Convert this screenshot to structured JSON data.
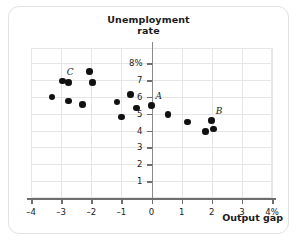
{
  "chart_data": {
    "type": "scatter",
    "title": "Unemployment rate",
    "title_line1": "Unemployment",
    "title_line2": "rate",
    "xlabel": "Output gap",
    "ylabel": "Unemployment rate",
    "xlim": [
      -4,
      4
    ],
    "ylim": [
      0,
      8.9
    ],
    "grid": true,
    "legend": "none",
    "x_unit": "%",
    "y_unit": "%",
    "xticks": [
      -4,
      -3,
      -2,
      -1,
      0,
      1,
      2,
      3,
      4
    ],
    "xticklabels": [
      "–4",
      "–3",
      "–2",
      "–1",
      "0",
      "1",
      "2",
      "3",
      "4%"
    ],
    "yticks": [
      1,
      2,
      3,
      4,
      5,
      6,
      7,
      8
    ],
    "yticklabels": [
      "1",
      "2",
      "3",
      "4",
      "5",
      "6",
      "7",
      "8%"
    ],
    "points": [
      {
        "x": -3.3,
        "y": 6.0,
        "label": ""
      },
      {
        "x": -2.95,
        "y": 6.95,
        "label": "C"
      },
      {
        "x": -2.75,
        "y": 6.85,
        "label": ""
      },
      {
        "x": -2.75,
        "y": 5.75,
        "label": ""
      },
      {
        "x": -2.3,
        "y": 5.55,
        "label": ""
      },
      {
        "x": -2.05,
        "y": 7.5,
        "label": ""
      },
      {
        "x": -1.95,
        "y": 6.85,
        "label": ""
      },
      {
        "x": -1.15,
        "y": 5.7,
        "label": ""
      },
      {
        "x": -1.0,
        "y": 4.8,
        "label": ""
      },
      {
        "x": -0.7,
        "y": 6.15,
        "label": ""
      },
      {
        "x": -0.5,
        "y": 5.35,
        "label": ""
      },
      {
        "x": 0.0,
        "y": 5.5,
        "label": "A"
      },
      {
        "x": 0.55,
        "y": 4.95,
        "label": ""
      },
      {
        "x": 1.2,
        "y": 4.5,
        "label": ""
      },
      {
        "x": 1.8,
        "y": 3.95,
        "label": ""
      },
      {
        "x": 2.0,
        "y": 4.6,
        "label": "B"
      },
      {
        "x": 2.05,
        "y": 4.1,
        "label": ""
      }
    ],
    "annotations": [
      {
        "text": "A",
        "x": 0.0,
        "y": 5.5,
        "position": "upper-right"
      },
      {
        "text": "B",
        "x": 2.0,
        "y": 4.6,
        "position": "upper-right"
      },
      {
        "text": "C",
        "x": -2.95,
        "y": 6.95,
        "position": "upper-right"
      }
    ],
    "colors": {
      "marker": "#111111",
      "grid": "#e6e6e6",
      "axis": "#6e6e6e",
      "text": "#1a1a1a",
      "frame": "#e2e2e2",
      "background": "#ffffff"
    }
  }
}
